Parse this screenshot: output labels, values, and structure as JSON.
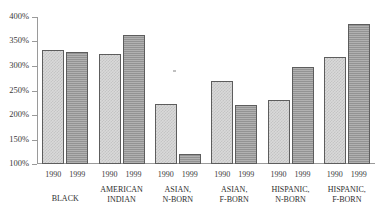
{
  "chart_data": {
    "type": "bar",
    "title": "",
    "xlabel": "",
    "ylabel": "",
    "ylim": [
      100,
      400
    ],
    "ytick_labels": [
      "400%",
      "350%",
      "300%",
      "250%",
      "200%",
      "150%",
      "100%"
    ],
    "ytick_values": [
      400,
      350,
      300,
      250,
      200,
      150,
      100
    ],
    "grid": false,
    "legend_position": "none",
    "categories": [
      "BLACK",
      "AMERICAN INDIAN",
      "ASIAN, N-BORN",
      "ASIAN, F-BORN",
      "HISPANIC, N-BORN",
      "HISPANIC, F-BORN"
    ],
    "category_lines": [
      [
        "BLACK"
      ],
      [
        "AMERICAN",
        "INDIAN"
      ],
      [
        "ASIAN,",
        "N-BORN"
      ],
      [
        "ASIAN,",
        "F-BORN"
      ],
      [
        "HISPANIC,",
        "N-BORN"
      ],
      [
        "HISPANIC,",
        "F-BORN"
      ]
    ],
    "series": [
      {
        "name": "1990",
        "values": [
          333,
          324,
          222,
          269,
          231,
          318
        ]
      },
      {
        "name": "1999",
        "values": [
          328,
          364,
          120,
          220,
          298,
          386
        ]
      }
    ],
    "series_names": [
      "1990",
      "1999"
    ],
    "colors": {
      "series_1990": "#d9d9d9",
      "series_1999": "#9b9b9b",
      "bar_outline": "#5d5d5d",
      "axis": "#9a9a9a"
    }
  }
}
